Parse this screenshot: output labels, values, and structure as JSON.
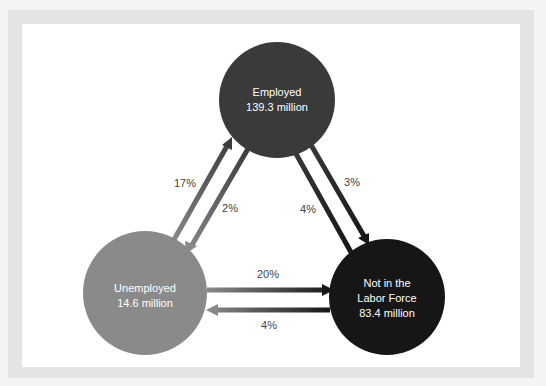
{
  "nodes": {
    "employed": {
      "name": "Employed",
      "value": "139.3 million",
      "color": "#3a3a3a"
    },
    "unemployed": {
      "name": "Unemployed",
      "value": "14.6 million",
      "color": "#8a8a8a"
    },
    "not_in_labor_force": {
      "line1": "Not in the",
      "line2": "Labor Force",
      "value": "83.4 million",
      "color": "#161616"
    }
  },
  "flows": {
    "unemployed_to_employed": "17%",
    "employed_to_unemployed": "2%",
    "employed_to_not_in_labor_force": "3%",
    "not_in_labor_force_to_employed": "4%",
    "unemployed_to_not_in_labor_force": "20%",
    "not_in_labor_force_to_unemployed": "4%"
  }
}
